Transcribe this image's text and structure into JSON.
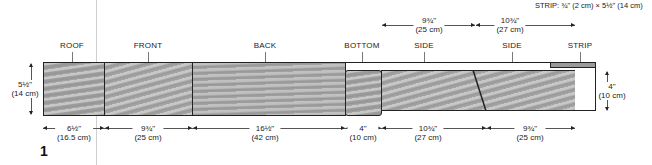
{
  "figure_number": "1",
  "strip_note": "STRIP: ¾\" (2 cm) × 5½\" (14 cm)",
  "pieces": {
    "roof": "ROOF",
    "front": "FRONT",
    "back": "BACK",
    "bottom": "BOTTOM",
    "side1": "SIDE",
    "side2": "SIDE",
    "strip": "STRIP"
  },
  "dimensions": {
    "board_height": {
      "imperial": "5½\"",
      "metric": "(14 cm)"
    },
    "right_height": {
      "imperial": "4\"",
      "metric": "(10 cm)"
    },
    "top_side1": {
      "imperial": "9¾\"",
      "metric": "(25 cm)"
    },
    "top_side2": {
      "imperial": "10¾\"",
      "metric": "(27 cm)"
    },
    "bottom": [
      {
        "name": "roof",
        "imperial": "6½\"",
        "metric": "(16.5 cm)"
      },
      {
        "name": "front",
        "imperial": "9¾\"",
        "metric": "(25 cm)"
      },
      {
        "name": "back",
        "imperial": "16½\"",
        "metric": "(42 cm)"
      },
      {
        "name": "bottom",
        "imperial": "4\"",
        "metric": "(10 cm)"
      },
      {
        "name": "side1",
        "imperial": "10¾\"",
        "metric": "(27 cm)"
      },
      {
        "name": "side2",
        "imperial": "9¾\"",
        "metric": "(25 cm)"
      }
    ]
  },
  "colors": {
    "outline": "#222222",
    "wood": "#a8a8a8",
    "gutter": "#cfcfcf"
  }
}
